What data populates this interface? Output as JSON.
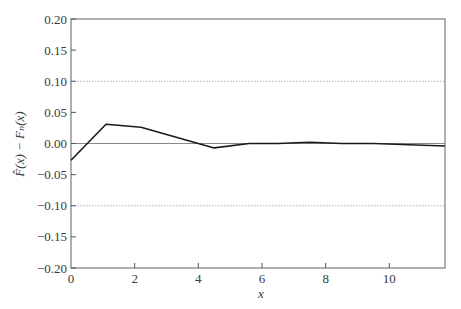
{
  "chart_data": {
    "type": "line",
    "title": "",
    "xlabel": "x",
    "ylabel": "F̂(x) − Fₙ(x)",
    "xlim": [
      0,
      11.75
    ],
    "ylim": [
      -0.2,
      0.2
    ],
    "x_ticks": [
      0,
      2,
      4,
      6,
      8,
      10
    ],
    "x_tick_labels": [
      "0",
      "2",
      "4",
      "6",
      "8",
      "10"
    ],
    "y_ticks": [
      0.2,
      0.15,
      0.1,
      0.05,
      0.0,
      -0.05,
      -0.1,
      -0.15,
      -0.2
    ],
    "y_tick_labels": [
      "0.20",
      "0.15",
      "0.10",
      "0.05",
      "0.00",
      "−0.05",
      "−0.10",
      "−0.15",
      "−0.20"
    ],
    "grid": {
      "horizontal_reference_lines": [
        {
          "y": 0.1,
          "style": "dotted",
          "color": "#b0b0b0"
        },
        {
          "y": 0.0,
          "style": "solid",
          "color": "#8a8a8a"
        },
        {
          "y": -0.1,
          "style": "dotted",
          "color": "#b0b0b0"
        }
      ]
    },
    "legend": null,
    "series": [
      {
        "name": "F̂(x) − Fₙ(x)",
        "color": "#1a1a1a",
        "x": [
          0.0,
          1.1,
          2.2,
          4.5,
          5.6,
          6.5,
          7.5,
          8.5,
          9.5,
          11.75
        ],
        "y": [
          -0.027,
          0.031,
          0.026,
          -0.007,
          0.0,
          0.0,
          0.002,
          0.0,
          0.0,
          -0.004
        ]
      }
    ]
  },
  "layout": {
    "plot_left": 71,
    "plot_right": 445,
    "plot_top": 19,
    "plot_bottom": 268
  }
}
